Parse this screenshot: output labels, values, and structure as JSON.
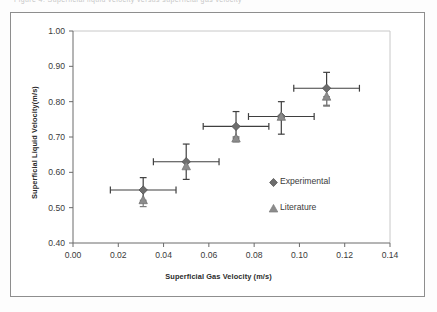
{
  "figure": {
    "caption_sliver": "Figure 4.  Superficial liquid velocity versus superficial gas velocity",
    "background_color": "#ffffff",
    "frame_color": "#8e8e8e"
  },
  "chart_data": {
    "type": "scatter",
    "title": "",
    "xlabel": "Superficial Gas Velocity (m/s)",
    "ylabel": "Superficial Liquid Velocity(m/s)",
    "xlim": [
      0.0,
      0.14
    ],
    "ylim": [
      0.4,
      1.0
    ],
    "xticks": [
      0.0,
      0.02,
      0.04,
      0.06,
      0.08,
      0.1,
      0.12,
      0.14
    ],
    "xtick_labels": [
      "0.00",
      "0.02",
      "0.04",
      "0.06",
      "0.08",
      "0.10",
      "0.12",
      "0.14"
    ],
    "yticks": [
      0.4,
      0.5,
      0.6,
      0.7,
      0.8,
      0.9,
      1.0
    ],
    "ytick_labels": [
      "0.40",
      "0.50",
      "0.60",
      "0.70",
      "0.80",
      "0.90",
      "1.00"
    ],
    "grid": false,
    "legend_position": "center-right-inside",
    "series": [
      {
        "name": "Experimental",
        "marker": "diamond",
        "color": "#6d6d6d",
        "x": [
          0.031,
          0.05,
          0.072,
          0.092,
          0.112
        ],
        "y": [
          0.55,
          0.63,
          0.73,
          0.758,
          0.838
        ],
        "xerr_low": [
          0.0145,
          0.0145,
          0.0145,
          0.0145,
          0.0145
        ],
        "xerr_high": [
          0.0145,
          0.0145,
          0.0145,
          0.0145,
          0.0145
        ],
        "yerr_low": [
          0.035,
          0.05,
          0.03,
          0.05,
          0.05
        ],
        "yerr_high": [
          0.035,
          0.05,
          0.042,
          0.042,
          0.045
        ]
      },
      {
        "name": "Literature",
        "marker": "triangle",
        "color": "#8c8c8c",
        "x": [
          0.031,
          0.05,
          0.072,
          0.092,
          0.112
        ],
        "y": [
          0.521,
          0.617,
          0.696,
          0.757,
          0.814
        ],
        "xerr_low": [
          0,
          0,
          0,
          0,
          0
        ],
        "xerr_high": [
          0,
          0,
          0,
          0,
          0
        ],
        "yerr_low": [
          0.018,
          0,
          0.01,
          0,
          0.024
        ],
        "yerr_high": [
          0,
          0,
          0,
          0,
          0
        ]
      }
    ],
    "legend_entries": [
      {
        "label": "Experimental",
        "marker": "diamond",
        "color": "#6d6d6d"
      },
      {
        "label": "Literature",
        "marker": "triangle",
        "color": "#8c8c8c"
      }
    ]
  },
  "axes_geometry": {
    "plot_left_px": 73,
    "plot_right_px": 390,
    "plot_top_px": 31,
    "plot_bottom_px": 243
  }
}
